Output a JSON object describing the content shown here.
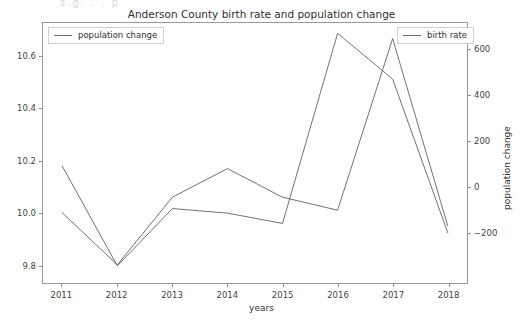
{
  "figure": {
    "ghost_text": "s.g.    .  . p",
    "title": "Anderson County birth rate and population change",
    "xlabel": "years",
    "ylabel_left": "birth rate",
    "ylabel_right": "population change",
    "line_color": "#707070",
    "axes_color": "#9a9a9a",
    "background": "#ffffff"
  },
  "legend": {
    "left": {
      "label": "population change"
    },
    "right": {
      "label": "birth rate"
    }
  },
  "axes": {
    "x_ticks": [
      "2011",
      "2012",
      "2013",
      "2014",
      "2015",
      "2016",
      "2017",
      "2018"
    ],
    "y_ticks_left": [
      "9.8",
      "10.0",
      "10.2",
      "10.4",
      "10.6"
    ],
    "y_ticks_right": [
      "-200",
      "0",
      "200",
      "400",
      "600"
    ]
  },
  "chart_data": {
    "type": "line",
    "title": "Anderson County birth rate and population change",
    "xlabel": "years",
    "ylabel": "birth rate",
    "ylabel_secondary": "population change",
    "x": [
      2011,
      2012,
      2013,
      2014,
      2015,
      2016,
      2017,
      2018
    ],
    "categories": [
      "2011",
      "2012",
      "2013",
      "2014",
      "2015",
      "2016",
      "2017",
      "2018"
    ],
    "grid": false,
    "legend_position": "upper-left and upper-right",
    "xlim": [
      2010.65,
      2018.35
    ],
    "ylim": [
      9.73,
      10.73
    ],
    "ylim_secondary": [
      -420,
      715
    ],
    "yticks": [
      9.8,
      10.0,
      10.2,
      10.4,
      10.6
    ],
    "yticks_secondary": [
      -200,
      0,
      200,
      400,
      600
    ],
    "series": [
      {
        "name": "birth rate",
        "axis": "left",
        "color": "#707070",
        "values": [
          10.0,
          9.8,
          10.06,
          10.17,
          10.06,
          10.01,
          10.67,
          9.95
        ]
      },
      {
        "name": "population change",
        "axis": "right",
        "color": "#707070",
        "values": [
          90,
          -345,
          -95,
          -115,
          -160,
          670,
          470,
          -200
        ]
      }
    ]
  }
}
